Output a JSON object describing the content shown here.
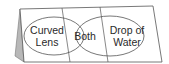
{
  "diagram": {
    "type": "three-tab foldable venn diagram",
    "left_label_line1": "Curved",
    "left_label_line2": "Lens",
    "center_label": "Both",
    "right_label_line1": "Drop of",
    "right_label_line2": "Water",
    "colors": {
      "paper": "#ffffff",
      "outline": "#555555",
      "back_panel": "#b8b8b8",
      "text": "#2a2a2a"
    }
  }
}
